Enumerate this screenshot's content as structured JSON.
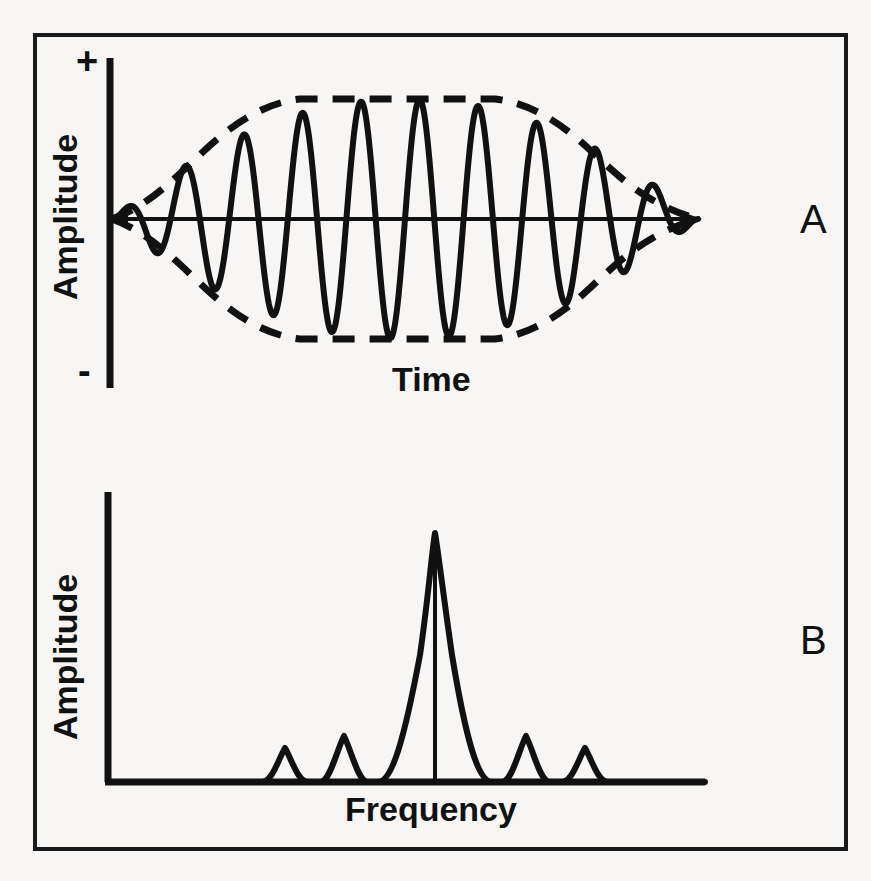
{
  "figure": {
    "background_color": "#f7f6f4",
    "ink_color": "#111111",
    "panels": [
      {
        "letter": "A",
        "name": "time-domain-wave-packet",
        "ylabel": "Amplitude",
        "xlabel": "Time",
        "y_axis_top_mark": "+",
        "y_axis_bottom_mark": "-"
      },
      {
        "letter": "B",
        "name": "frequency-domain-spectrum",
        "ylabel": "Amplitude",
        "xlabel": "Frequency"
      }
    ]
  },
  "chart_data": [
    {
      "type": "line",
      "name": "panel-A-wave-packet",
      "title": "A",
      "xlabel": "Time",
      "ylabel": "Amplitude",
      "xlim": [
        0,
        1
      ],
      "ylim": [
        -1,
        1
      ],
      "grid": false,
      "legend": null,
      "ytick_labels": [
        "+",
        "-"
      ],
      "xtick_labels": [],
      "description": "Sinusoidal carrier of about 10 cycles multiplied by a lens-shaped (flat-topped) amplitude envelope that rises from zero at the left, plateaus across the middle, then falls back to zero at the right.",
      "series": [
        {
          "name": "carrier-oscillation",
          "style": "solid",
          "cycles": 10,
          "carrier_phase_deg": 0
        },
        {
          "name": "upper-envelope",
          "style": "dashed",
          "points_x": [
            0.0,
            0.08,
            0.16,
            0.24,
            0.32,
            0.4,
            0.5,
            0.6,
            0.68,
            0.76,
            0.84,
            0.92,
            1.0
          ],
          "points_y": [
            0.0,
            0.3,
            0.55,
            0.74,
            0.88,
            0.97,
            1.0,
            0.97,
            0.88,
            0.74,
            0.55,
            0.3,
            0.0
          ]
        },
        {
          "name": "lower-envelope",
          "style": "dashed",
          "points_x": [
            0.0,
            0.08,
            0.16,
            0.24,
            0.32,
            0.4,
            0.5,
            0.6,
            0.68,
            0.76,
            0.84,
            0.92,
            1.0
          ],
          "points_y": [
            0.0,
            -0.3,
            -0.55,
            -0.74,
            -0.88,
            -0.97,
            -1.0,
            -0.97,
            -0.88,
            -0.74,
            -0.55,
            -0.3,
            0.0
          ]
        },
        {
          "name": "zero-baseline",
          "style": "solid",
          "value": 0
        }
      ]
    },
    {
      "type": "line",
      "name": "panel-B-spectrum",
      "title": "B",
      "xlabel": "Frequency",
      "ylabel": "Amplitude",
      "xlim": [
        0,
        1
      ],
      "ylim": [
        0,
        1
      ],
      "grid": false,
      "legend": null,
      "ytick_labels": [],
      "xtick_labels": [],
      "description": "Sinc-like magnitude spectrum: one tall narrow central lobe at the carrier frequency with a vertical line marking its centre, flanked on each side by two progressively smaller rectified side lobes; the curve rests on a zero baseline elsewhere.",
      "series": [
        {
          "name": "spectrum-envelope",
          "style": "solid",
          "lobes": [
            {
              "name": "outer-left-lobe",
              "center": 0.285,
              "half_width": 0.048,
              "height": 0.115
            },
            {
              "name": "inner-left-lobe",
              "center": 0.382,
              "half_width": 0.048,
              "height": 0.165
            },
            {
              "name": "main-lobe",
              "center": 0.545,
              "half_width": 0.115,
              "height": 1.0
            },
            {
              "name": "inner-right-lobe",
              "center": 0.71,
              "half_width": 0.048,
              "height": 0.165
            },
            {
              "name": "outer-right-lobe",
              "center": 0.807,
              "half_width": 0.048,
              "height": 0.115
            }
          ]
        },
        {
          "name": "main-lobe-center-line",
          "style": "solid-vertical",
          "x": 0.545,
          "y_from": 0,
          "y_to": 1.0
        }
      ]
    }
  ]
}
